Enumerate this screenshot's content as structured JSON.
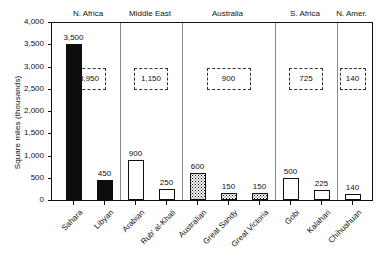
{
  "chart_data": {
    "type": "bar",
    "title": "",
    "xlabel": "",
    "ylabel": "Square miles (thousands)",
    "ylim": [
      0,
      4000
    ],
    "yticks": [
      0,
      500,
      1000,
      1500,
      2000,
      2500,
      3000,
      3500,
      4000
    ],
    "ytick_labels": [
      "0",
      "500",
      "1,000",
      "1,500",
      "2,000",
      "2,500",
      "3,000",
      "3,500",
      "4,000"
    ],
    "grid": false,
    "legend": "none",
    "categories": [
      "Sahara",
      "Libyan",
      "Arabian",
      "Rub' al-Khali",
      "Australian",
      "Great Sandy",
      "Great Victoria",
      "Gobi",
      "Kalahari",
      "Chihuahuan"
    ],
    "values": [
      3500,
      450,
      900,
      250,
      600,
      150,
      150,
      500,
      225,
      140
    ],
    "value_labels": [
      "3,500",
      "450",
      "900",
      "250",
      "600",
      "150",
      "150",
      "500",
      "225",
      "140"
    ],
    "bar_fills": [
      "solid",
      "solid",
      "open",
      "open",
      "stipple",
      "stipple",
      "stipple",
      "open",
      "open",
      "open"
    ],
    "regions": [
      {
        "name": "N. Africa",
        "total": "3,950",
        "members": [
          "Sahara",
          "Libyan"
        ]
      },
      {
        "name": "Middle East",
        "total": "1,150",
        "members": [
          "Arabian",
          "Rub' al-Khali"
        ]
      },
      {
        "name": "Australia",
        "total": "900",
        "members": [
          "Australian",
          "Great Sandy",
          "Great Victoria"
        ]
      },
      {
        "name": "S. Africa",
        "total": "725",
        "members": [
          "Gobi",
          "Kalahari"
        ]
      },
      {
        "name": "N. Amer.",
        "total": "140",
        "members": [
          "Chihuahuan"
        ]
      }
    ]
  },
  "colors": {
    "axis": "#111111",
    "bar_solid": "#0d0d0d",
    "bar_open": "#ffffff",
    "divider": "#8a8a8a",
    "total_box_border": "#333333",
    "background": "#ffffff"
  }
}
